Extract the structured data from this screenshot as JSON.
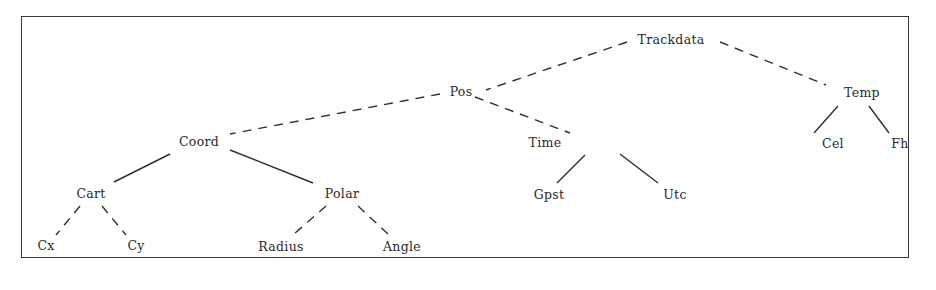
{
  "diagram": {
    "type": "tree",
    "root": "Trackdata",
    "nodes": [
      {
        "id": "trackdata",
        "label": "Trackdata",
        "x": 671,
        "y": 40
      },
      {
        "id": "pos",
        "label": "Pos",
        "x": 461,
        "y": 92
      },
      {
        "id": "temp",
        "label": "Temp",
        "x": 862,
        "y": 93
      },
      {
        "id": "coord",
        "label": "Coord",
        "x": 199,
        "y": 142
      },
      {
        "id": "time",
        "label": "Time",
        "x": 545,
        "y": 143
      },
      {
        "id": "cel",
        "label": "Cel",
        "x": 833,
        "y": 144
      },
      {
        "id": "fh",
        "label": "Fh",
        "x": 900,
        "y": 144
      },
      {
        "id": "cart",
        "label": "Cart",
        "x": 91,
        "y": 194
      },
      {
        "id": "polar",
        "label": "Polar",
        "x": 342,
        "y": 194
      },
      {
        "id": "gpst",
        "label": "Gpst",
        "x": 549,
        "y": 195
      },
      {
        "id": "utc",
        "label": "Utc",
        "x": 675,
        "y": 195
      },
      {
        "id": "cx",
        "label": "Cx",
        "x": 46,
        "y": 246
      },
      {
        "id": "cy",
        "label": "Cy",
        "x": 136,
        "y": 246
      },
      {
        "id": "radius",
        "label": "Radius",
        "x": 281,
        "y": 247
      },
      {
        "id": "angle",
        "label": "Angle",
        "x": 402,
        "y": 247
      }
    ],
    "edges": [
      {
        "from": "trackdata",
        "to": "pos",
        "style": "dashed",
        "x1": 627,
        "y1": 42,
        "x2": 486,
        "y2": 90
      },
      {
        "from": "trackdata",
        "to": "temp",
        "style": "dashed",
        "x1": 720,
        "y1": 42,
        "x2": 826,
        "y2": 85
      },
      {
        "from": "pos",
        "to": "coord",
        "style": "dashed",
        "x1": 440,
        "y1": 94,
        "x2": 230,
        "y2": 134
      },
      {
        "from": "pos",
        "to": "time",
        "style": "dashed",
        "x1": 475,
        "y1": 97,
        "x2": 570,
        "y2": 133
      },
      {
        "from": "temp",
        "to": "cel",
        "style": "solid",
        "x1": 838,
        "y1": 106,
        "x2": 814,
        "y2": 133
      },
      {
        "from": "temp",
        "to": "fh",
        "style": "solid",
        "x1": 869,
        "y1": 106,
        "x2": 889,
        "y2": 133
      },
      {
        "from": "coord",
        "to": "cart",
        "style": "solid",
        "x1": 170,
        "y1": 154,
        "x2": 114,
        "y2": 182
      },
      {
        "from": "coord",
        "to": "polar",
        "style": "solid",
        "x1": 230,
        "y1": 150,
        "x2": 313,
        "y2": 183
      },
      {
        "from": "time",
        "to": "gpst",
        "style": "solid",
        "x1": 585,
        "y1": 155,
        "x2": 557,
        "y2": 183
      },
      {
        "from": "time",
        "to": "utc",
        "style": "solid",
        "x1": 620,
        "y1": 154,
        "x2": 658,
        "y2": 183
      },
      {
        "from": "cart",
        "to": "cx",
        "style": "dashed",
        "x1": 80,
        "y1": 206,
        "x2": 56,
        "y2": 235
      },
      {
        "from": "cart",
        "to": "cy",
        "style": "dashed",
        "x1": 102,
        "y1": 206,
        "x2": 126,
        "y2": 235
      },
      {
        "from": "polar",
        "to": "radius",
        "style": "dashed",
        "x1": 326,
        "y1": 206,
        "x2": 293,
        "y2": 235
      },
      {
        "from": "polar",
        "to": "angle",
        "style": "dashed",
        "x1": 358,
        "y1": 206,
        "x2": 389,
        "y2": 235
      }
    ],
    "colors": {
      "line": "#2f2f2f",
      "text": "#2a2a2a",
      "frame": "#3a3a3a",
      "background": "#ffffff"
    }
  }
}
